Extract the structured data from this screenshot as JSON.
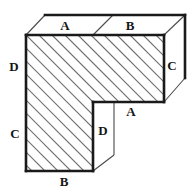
{
  "figure": {
    "background_color": "#ffffff",
    "edge_color": "#1a1a1a",
    "hidden_edge_color": "#4a4a4a",
    "hatch_color": "#6e6e6e",
    "label_color": "#161616",
    "labels": [
      {
        "id": "label-a-top",
        "text": "A",
        "x": 65,
        "y": 25
      },
      {
        "id": "label-b-top",
        "text": "B",
        "x": 130,
        "y": 25
      },
      {
        "id": "label-c-right",
        "text": "C",
        "x": 172,
        "y": 65
      },
      {
        "id": "label-d-left",
        "text": "D",
        "x": 14,
        "y": 66
      },
      {
        "id": "label-a-inner",
        "text": "A",
        "x": 131,
        "y": 111
      },
      {
        "id": "label-d-inner",
        "text": "D",
        "x": 103,
        "y": 130
      },
      {
        "id": "label-c-left",
        "text": "C",
        "x": 15,
        "y": 133
      },
      {
        "id": "label-b-bottom",
        "text": "B",
        "x": 64,
        "y": 181
      }
    ],
    "geometry": {
      "front_face_outline": "M26,35 L164,35 L164,102 L93,102 L93,171 L26,171 Z",
      "top_face_outline": "M26,35 L45,15 L185,15 L164,35 Z",
      "right_face_outline": "M164,35 L185,15 L185,78 L164,102 Z",
      "notch_face_outline": "M93,102 L114,102 L114,155 L93,171 Z",
      "top_divider": "M113,15 L93,35",
      "notch_inner_vertical": "M114,102 L114,155",
      "notch_bottom_diagonal": "M114,155 L93,171",
      "bottom_right_diagonal": "M93,171 L114,155",
      "hatch_angle_deg": 45,
      "hatch_spacing_px": 13
    }
  }
}
